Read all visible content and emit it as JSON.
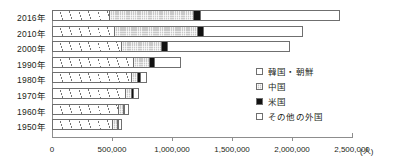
{
  "chart_data": {
    "type": "bar",
    "orientation": "horizontal",
    "stacked": true,
    "title": "",
    "xlabel": "(人)",
    "ylabel": "",
    "xlim": [
      0,
      2500000
    ],
    "xticks": [
      0,
      500000,
      1000000,
      1500000,
      2000000,
      2500000
    ],
    "xticklabels": [
      "0",
      "500,000",
      "1,000,000",
      "1,500,000",
      "2,000,000",
      "2,500,000"
    ],
    "unit_label": "(人)",
    "grid": false,
    "legend_position": "right-middle",
    "categories": [
      "2016年",
      "2010年",
      "2000年",
      "1990年",
      "1980年",
      "1970年",
      "1960年",
      "1950年"
    ],
    "series": [
      {
        "name": "韓国・朝鮮",
        "pattern": "diagonal-hatch",
        "color": "#ffffff",
        "values": [
          485000,
          525000,
          580000,
          680000,
          665000,
          615000,
          555000,
          510000
        ]
      },
      {
        "name": "中国",
        "pattern": "light-dotted-gray",
        "color": "#c9c9c9",
        "values": [
          700000,
          690000,
          340000,
          140000,
          52000,
          50000,
          45000,
          40000
        ]
      },
      {
        "name": "米国",
        "pattern": "solid-black",
        "color": "#111111",
        "values": [
          53000,
          50000,
          44000,
          38000,
          22000,
          20000,
          12000,
          10000
        ]
      },
      {
        "name": "その他の外国",
        "pattern": "white",
        "color": "#ffffff",
        "values": [
          1162000,
          825000,
          1022000,
          217000,
          56000,
          40000,
          32000,
          25000
        ]
      }
    ],
    "totals": [
      2400000,
      2090000,
      1986000,
      1075000,
      795000,
      725000,
      644000,
      585000
    ]
  },
  "legend": {
    "items": [
      {
        "label": "韓国・朝鮮",
        "swatch": "korea-swatch"
      },
      {
        "label": "中国",
        "swatch": "china-swatch"
      },
      {
        "label": "米国",
        "swatch": "usa-swatch"
      },
      {
        "label": "その他の外国",
        "swatch": "other-swatch"
      }
    ]
  }
}
